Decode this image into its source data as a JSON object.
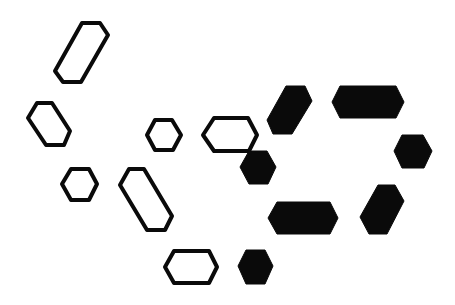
{
  "diagram": {
    "colors": {
      "background": "#ffffff",
      "ink": "#0a0a0a"
    },
    "shapes": [
      {
        "id": "outline-elongated-top",
        "style": "outline",
        "points": "82,23 100,23 108,35 81,82 63,82 55,71"
      },
      {
        "id": "outline-hex-left",
        "style": "outline",
        "points": "37,103 52,103 70,131 64,145 46,145 28,118"
      },
      {
        "id": "outline-hex-small-center",
        "style": "outline",
        "points": "155,120 172,120 181,135 173,150 155,150 147,135"
      },
      {
        "id": "outline-wide-center",
        "style": "outline",
        "points": "214,118 248,118 257,135 249,151 214,151 203,135"
      },
      {
        "id": "filled-tilted-top",
        "style": "filled",
        "points": "286,86 305,86 312,101 292,134 273,134 267,120"
      },
      {
        "id": "filled-wide-top",
        "style": "filled",
        "points": "340,86 396,86 404,102 396,118 340,118 332,102"
      },
      {
        "id": "filled-hex-right",
        "style": "filled",
        "points": "402,135 423,135 432,151 424,168 402,168 394,151"
      },
      {
        "id": "filled-hex-center",
        "style": "filled",
        "points": "249,151 267,151 276,167 268,184 249,184 240,167"
      },
      {
        "id": "outline-hex-small-left",
        "style": "outline",
        "points": "71,169 89,169 97,184 89,200 71,200 62,184"
      },
      {
        "id": "outline-elongated-bottom",
        "style": "outline",
        "points": "129,169 144,169 172,216 165,230 147,230 120,185"
      },
      {
        "id": "filled-wide-bottom",
        "style": "filled",
        "points": "277,202 330,202 338,218 330,234 277,234 268,218"
      },
      {
        "id": "filled-tilted-bottom",
        "style": "filled",
        "points": "378,185 395,185 404,201 387,234 369,234 360,217"
      },
      {
        "id": "outline-wide-bottom",
        "style": "outline",
        "points": "174,251 209,251 217,267 209,283 174,283 165,267"
      },
      {
        "id": "filled-hex-bottom",
        "style": "filled",
        "points": "246,250 265,250 273,266 265,284 246,284 238,266"
      }
    ]
  }
}
